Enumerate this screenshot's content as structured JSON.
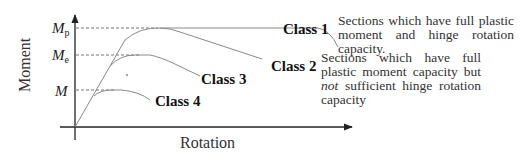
{
  "axes": {
    "y_label": "Moment",
    "x_label": "Rotation"
  },
  "levels": [
    {
      "id": "Mp",
      "symbol": "M",
      "subscript": "p"
    },
    {
      "id": "Me",
      "symbol": "M",
      "subscript": "e"
    },
    {
      "id": "M",
      "symbol": "M",
      "subscript": ""
    }
  ],
  "classes": [
    {
      "label": "Class 1",
      "reaches_level": "Mp",
      "behaviour": "maintains plastic moment over large rotation"
    },
    {
      "label": "Class 2",
      "reaches_level": "Mp",
      "behaviour": "reaches plastic moment then declines"
    },
    {
      "label": "Class 3",
      "reaches_level": "Me",
      "behaviour": "reaches elastic moment then declines"
    },
    {
      "label": "Class 4",
      "reaches_level": "M",
      "behaviour": "local buckling before elastic moment"
    }
  ],
  "descriptions": {
    "class1": "Sections which have full plastic moment and hinge rotation capacity.",
    "class2_part1": "Sections which have full plastic moment capacity but ",
    "class2_emph": "not",
    "class2_part2": " sufficient hinge rotation capacity"
  },
  "colors": {
    "text": "#222222",
    "curve": "#8a8a8a",
    "axis": "#222222"
  }
}
